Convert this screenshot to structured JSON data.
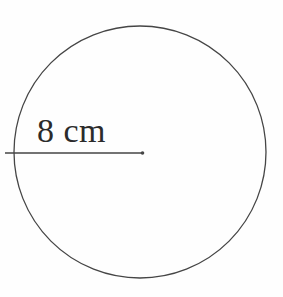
{
  "figure": {
    "type": "circle-with-radius",
    "radius_label": "8 cm",
    "colors": {
      "stroke": "#454545",
      "text": "#2b2b2b",
      "background": "#fefefe"
    }
  }
}
